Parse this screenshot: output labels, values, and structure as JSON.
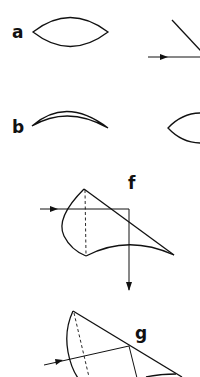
{
  "figure": {
    "colors": {
      "ink": "#111111",
      "background": "#ffffff"
    }
  },
  "panels": [
    {
      "id": "a",
      "label": "a",
      "shape": "biconvex lens"
    },
    {
      "id": "b",
      "label": "b",
      "shape": "meniscus lens"
    },
    {
      "id": "f",
      "label": "f",
      "shape": "lens section with incident ray reflected downward"
    },
    {
      "id": "g",
      "label": "g",
      "shape": "tilted lens section with incident ray"
    }
  ],
  "partial_panels_right_edge": [
    {
      "shape": "diagonal line with incident arrow ray"
    },
    {
      "shape": "partial biconvex lens"
    }
  ]
}
